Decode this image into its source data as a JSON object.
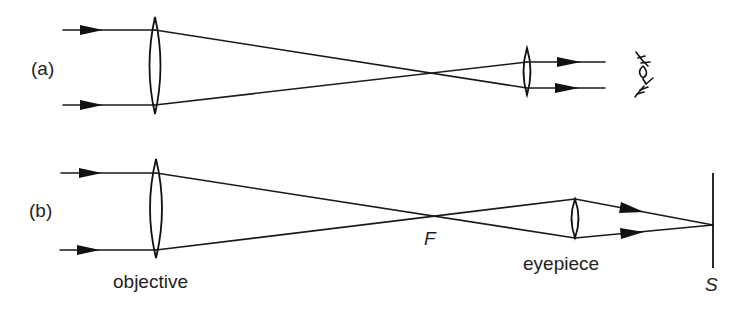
{
  "figure": {
    "panel_a": {
      "label": "(a)",
      "description": "Telescope in normal adjustment: parallel rays in, parallel rays out to eye",
      "eye_symbol": "eye-icon"
    },
    "panel_b": {
      "label": "(b)",
      "description": "Telescope with eyepiece moved to project a real image onto a screen",
      "focal_point_label": "F",
      "objective_label": "objective",
      "eyepiece_label": "eyepiece",
      "screen_label": "S"
    },
    "colors": {
      "ink": "#111111",
      "background": "#ffffff"
    }
  }
}
